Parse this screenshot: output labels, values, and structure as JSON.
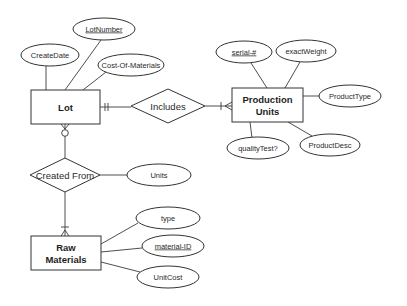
{
  "diagram": {
    "type": "entity-relationship",
    "entities": [
      {
        "id": "lot",
        "label_lines": [
          "Lot"
        ]
      },
      {
        "id": "production_units",
        "label_lines": [
          "Production",
          "Units"
        ]
      },
      {
        "id": "raw_materials",
        "label_lines": [
          "Raw",
          "Materials"
        ]
      }
    ],
    "relationships": [
      {
        "id": "includes",
        "label": "Includes",
        "from": "lot",
        "to": "production_units",
        "from_cardinality": "one-and-only-one",
        "to_cardinality": "one-or-many"
      },
      {
        "id": "created_from",
        "label": "Created From",
        "from": "lot",
        "to": "raw_materials",
        "from_cardinality": "zero-or-many",
        "to_cardinality": "one-or-many"
      }
    ],
    "attributes": {
      "lot": [
        {
          "label": "LotNumber",
          "key": true
        },
        {
          "label": "CreateDate",
          "key": false
        },
        {
          "label": "Cost-Of-Materials",
          "key": false
        }
      ],
      "production_units": [
        {
          "label": "serial-#",
          "key": true
        },
        {
          "label": "exactWeight",
          "key": false
        },
        {
          "label": "ProductType",
          "key": false
        },
        {
          "label": "ProductDesc",
          "key": false
        },
        {
          "label": "qualityTest?",
          "key": false
        }
      ],
      "created_from": [
        {
          "label": "Units",
          "key": false
        }
      ],
      "raw_materials": [
        {
          "label": "type",
          "key": false
        },
        {
          "label": "material-ID",
          "key": true
        },
        {
          "label": "UnitCost",
          "key": false
        }
      ]
    }
  }
}
